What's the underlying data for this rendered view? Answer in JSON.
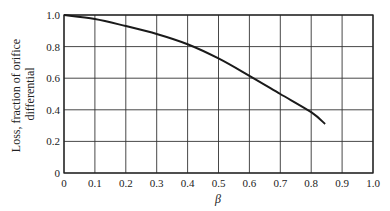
{
  "chart_data": {
    "type": "line",
    "title": "",
    "xlabel": "β",
    "ylabel": "Loss, fraction of orifice differential",
    "ylabel_lines": [
      "Loss, fraction of orifice",
      "differential"
    ],
    "xlim": [
      0,
      1.0
    ],
    "ylim": [
      0,
      1.0
    ],
    "grid": true,
    "x_ticks": [
      "0",
      "0.1",
      "0.2",
      "0.3",
      "0.4",
      "0.5",
      "0.6",
      "0.7",
      "0.8",
      "0.9",
      "1.0"
    ],
    "y_ticks": [
      "0",
      "0.2",
      "0.4",
      "0.6",
      "0.8",
      "1.0"
    ],
    "series": [
      {
        "name": "Loss",
        "x": [
          0,
          0.1,
          0.2,
          0.3,
          0.4,
          0.5,
          0.6,
          0.7,
          0.8,
          0.845
        ],
        "y": [
          1.0,
          0.975,
          0.93,
          0.88,
          0.815,
          0.725,
          0.615,
          0.5,
          0.385,
          0.31
        ]
      }
    ]
  }
}
